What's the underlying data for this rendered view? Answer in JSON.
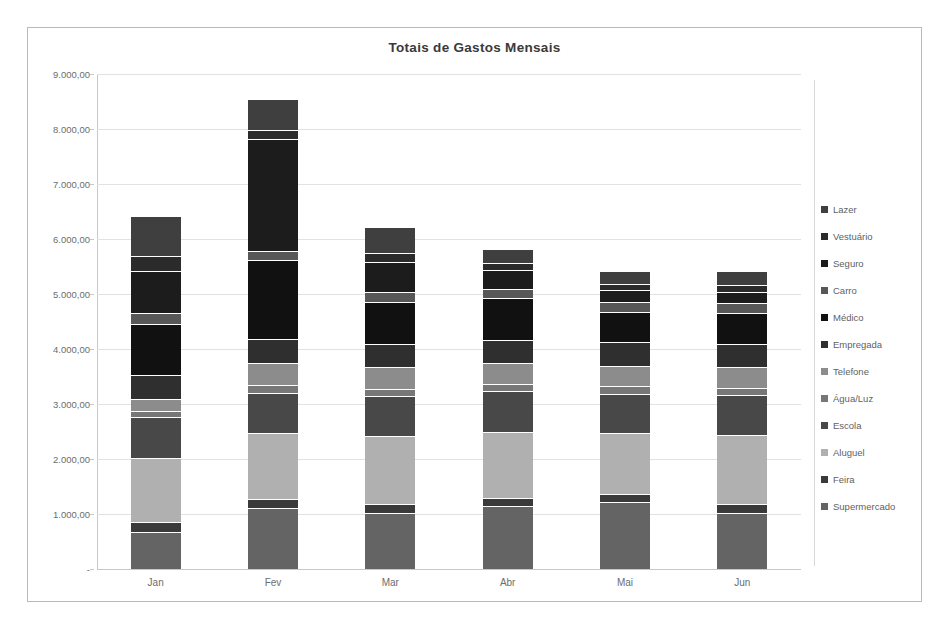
{
  "chart": {
    "title": "Totais de Gastos Mensais",
    "border_color": "#b9b9b9",
    "grid_color": "#e2e2e2",
    "axis_text_color": "#6d6d6d"
  },
  "axis": {
    "y_tick_labels": [
      "9.000,00",
      "8.000,00",
      "7.000,00",
      "6.000,00",
      "5.000,00",
      "4.000,00",
      "3.000,00",
      "2.000,00",
      "1.000,00",
      "-"
    ],
    "x_tick_labels": [
      "Jan",
      "Fev",
      "Mar",
      "Abr",
      "Mai",
      "Jun"
    ]
  },
  "legend": {
    "items": [
      {
        "label": "Lazer",
        "color": "#3f3f3f"
      },
      {
        "label": "Vestuário",
        "color": "#2b2b2b"
      },
      {
        "label": "Seguro",
        "color": "#1c1c1c"
      },
      {
        "label": "Carro",
        "color": "#575757"
      },
      {
        "label": "Médico",
        "color": "#111111"
      },
      {
        "label": "Empregada",
        "color": "#2f2f2f"
      },
      {
        "label": "Telefone",
        "color": "#8c8c8c"
      },
      {
        "label": "Água/Luz",
        "color": "#777777"
      },
      {
        "label": "Escola",
        "color": "#484848"
      },
      {
        "label": "Aluguel",
        "color": "#b0b0b0"
      },
      {
        "label": "Feira",
        "color": "#3a3a3a"
      },
      {
        "label": "Supermercado",
        "color": "#646464"
      }
    ]
  },
  "chart_data": {
    "type": "bar",
    "subtype": "stacked",
    "title": "Totais de Gastos Mensais",
    "xlabel": "",
    "ylabel": "",
    "ylim": [
      0,
      9000
    ],
    "ytick_step": 1000,
    "grid": true,
    "legend_position": "right",
    "categories": [
      "Jan",
      "Fev",
      "Mar",
      "Abr",
      "Mai",
      "Jun"
    ],
    "series": [
      {
        "name": "Supermercado",
        "color": "#646464",
        "values": [
          680,
          1110,
          1020,
          1140,
          1210,
          1020
        ]
      },
      {
        "name": "Feira",
        "color": "#3a3a3a",
        "values": [
          170,
          170,
          170,
          150,
          150,
          170
        ]
      },
      {
        "name": "Aluguel",
        "color": "#b0b0b0",
        "values": [
          1170,
          1190,
          1220,
          1200,
          1110,
          1250
        ]
      },
      {
        "name": "Escola",
        "color": "#484848",
        "values": [
          740,
          730,
          740,
          740,
          720,
          730
        ]
      },
      {
        "name": "Água/Luz",
        "color": "#777777",
        "values": [
          120,
          140,
          130,
          130,
          130,
          130
        ]
      },
      {
        "name": "Telefone",
        "color": "#8c8c8c",
        "values": [
          220,
          410,
          400,
          380,
          380,
          370
        ]
      },
      {
        "name": "Empregada",
        "color": "#2f2f2f",
        "values": [
          420,
          430,
          420,
          420,
          420,
          420
        ]
      },
      {
        "name": "Médico",
        "color": "#111111",
        "values": [
          930,
          1430,
          760,
          760,
          560,
          560
        ]
      },
      {
        "name": "Carro",
        "color": "#575757",
        "values": [
          200,
          180,
          180,
          180,
          180,
          180
        ]
      },
      {
        "name": "Seguro",
        "color": "#1c1c1c",
        "values": [
          760,
          2030,
          550,
          340,
          210,
          210
        ]
      },
      {
        "name": "Vestuário",
        "color": "#2b2b2b",
        "values": [
          290,
          160,
          150,
          120,
          120,
          120
        ]
      },
      {
        "name": "Lazer",
        "color": "#3f3f3f",
        "values": [
          720,
          570,
          480,
          260,
          230,
          260
        ]
      }
    ],
    "totals": [
      6420,
      8550,
      6220,
      5820,
      5420,
      5420
    ]
  }
}
